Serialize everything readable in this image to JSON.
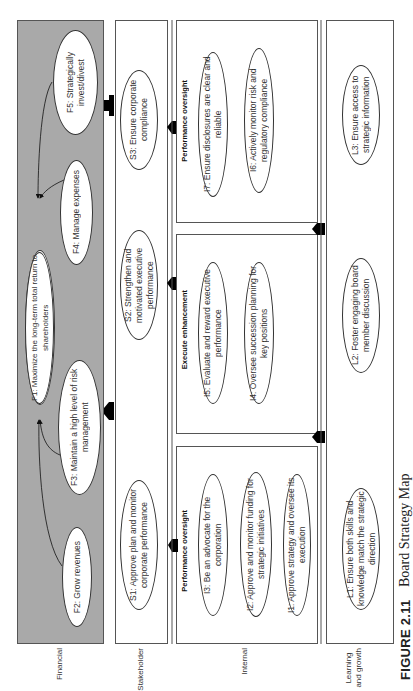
{
  "figure": {
    "number": "FIGURE 2.11",
    "title": "Board Strategy Map",
    "orientation": "rotated 90 degrees clockwise"
  },
  "colors": {
    "financial_panel": "#a9a9a9",
    "border": "#555555",
    "node_fill": "#ffffff",
    "arrow": "#000000"
  },
  "perspectives": [
    {
      "id": "financial",
      "label": "Financial",
      "nodes": [
        {
          "id": "F1",
          "text": "F1: Maximize the long-term total return to shareholders"
        },
        {
          "id": "F2",
          "text": "F2: Grow revenues"
        },
        {
          "id": "F3",
          "text": "F3: Maintain a high level of risk management"
        },
        {
          "id": "F4",
          "text": "F4: Manage expenses"
        },
        {
          "id": "F5",
          "text": "F5: Strategically invest/divest"
        }
      ]
    },
    {
      "id": "stakeholder",
      "label": "Stakeholder",
      "nodes": [
        {
          "id": "S1",
          "text": "S1: Approve plan and monitor corporate performance"
        },
        {
          "id": "S2",
          "text": "S2: Strengthen and motivated executive performance"
        },
        {
          "id": "S3",
          "text": "S3: Ensure corporate compliance"
        }
      ]
    },
    {
      "id": "internal",
      "label": "Internal",
      "groups": [
        {
          "label": "Performance oversight",
          "nodes": [
            {
              "id": "I3",
              "text": "I3: Be an advocate for the corporation"
            },
            {
              "id": "I2",
              "text": "I2: Approve and monitor funding for strategic initiatives"
            },
            {
              "id": "I1",
              "text": "I1: Approve strategy and oversee its execution"
            }
          ]
        },
        {
          "label": "Execute enhancement",
          "nodes": [
            {
              "id": "I5",
              "text": "I5: Evaluate and reward executive performance"
            },
            {
              "id": "I4",
              "text": "I4: Oversee succession planning for key positions"
            }
          ]
        },
        {
          "label": "Performance oversight",
          "nodes": [
            {
              "id": "I7",
              "text": "I7: Ensure disclosures are clear and reliable"
            },
            {
              "id": "I6",
              "text": "I6: Actively monitor risk and regulatory compliance"
            }
          ]
        }
      ]
    },
    {
      "id": "learning",
      "label": "Learning and growth",
      "label_lines": [
        "Learning",
        "and growth"
      ],
      "nodes": [
        {
          "id": "L1",
          "text": "L1: Ensure both skills and knowledge match the strategic direction"
        },
        {
          "id": "L2",
          "text": "L2: Foster engaging board member discussion"
        },
        {
          "id": "L3",
          "text": "L3: Ensure access to strategic information"
        }
      ]
    }
  ],
  "links": [
    {
      "from": "F2",
      "to": "F1"
    },
    {
      "from": "F3",
      "to": "F1"
    },
    {
      "from": "F4",
      "to": "F1"
    },
    {
      "from": "F5",
      "to": "F1"
    }
  ],
  "block_arrows": [
    {
      "from": "stakeholder",
      "to": "financial",
      "count": 2
    },
    {
      "from": "internal",
      "to": "stakeholder",
      "count": 3
    },
    {
      "from": "learning",
      "to": "internal",
      "count": 2
    }
  ]
}
